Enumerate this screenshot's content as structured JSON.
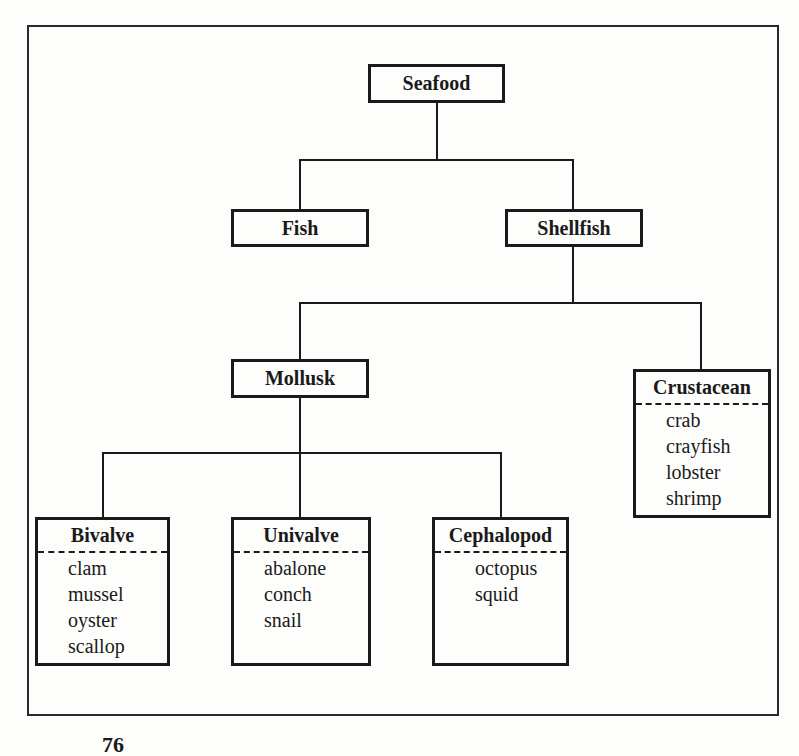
{
  "diagram": {
    "root": {
      "label": "Seafood"
    },
    "level1": [
      {
        "label": "Fish"
      },
      {
        "label": "Shellfish"
      }
    ],
    "level2": [
      {
        "label": "Mollusk"
      },
      {
        "label": "Crustacean",
        "items": [
          "crab",
          "crayfish",
          "lobster",
          "shrimp"
        ]
      }
    ],
    "level3": [
      {
        "label": "Bivalve",
        "items": [
          "clam",
          "mussel",
          "oyster",
          "scallop"
        ]
      },
      {
        "label": "Univalve",
        "items": [
          "abalone",
          "conch",
          "snail"
        ]
      },
      {
        "label": "Cephalopod",
        "items": [
          "octopus",
          "squid"
        ]
      }
    ]
  },
  "page": {
    "number": "76"
  }
}
